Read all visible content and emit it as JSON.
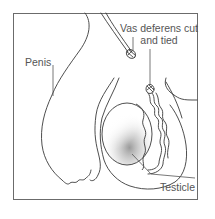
{
  "diagram": {
    "labels": {
      "penis": "Penis",
      "vas_line1": "Vas deferens cut",
      "vas_line2": "and tied",
      "testicle": "Testicle"
    },
    "colors": {
      "stroke": "#3a3a3a",
      "frame": "#6b6b6b",
      "text": "#555555",
      "background": "#ffffff",
      "shading": "#9a9a9a"
    }
  }
}
